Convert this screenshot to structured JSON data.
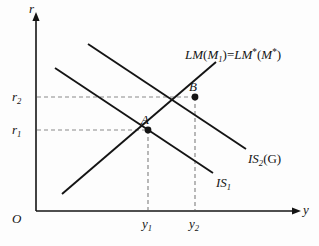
{
  "figure": {
    "type": "is-lm-diagram",
    "background_color": "#fdfdfd",
    "line_color": "#141414",
    "dash_color": "#8a8a8a"
  },
  "axes": {
    "vertical_label": "r",
    "horizontal_label": "y",
    "origin_label": "O"
  },
  "ticks": {
    "r1": {
      "base": "r",
      "sub": "1",
      "value_y": 130
    },
    "r2": {
      "base": "r",
      "sub": "2",
      "value_y": 97
    },
    "y1": {
      "base": "y",
      "sub": "1",
      "value_x": 148
    },
    "y2": {
      "base": "y",
      "sub": "2",
      "value_x": 195
    }
  },
  "curves": {
    "lm": {
      "label_base": "LM",
      "label_arg_open": "(",
      "label_m": "M",
      "label_m_sub": "1",
      "label_arg_close": ")",
      "label_equals": "=",
      "label_base2": "LM",
      "label_star1": "*",
      "label_arg2_open": "(",
      "label_m2": "M",
      "label_star2": "*",
      "label_arg2_close": ")"
    },
    "is1": {
      "base": "IS",
      "sub": "1"
    },
    "is2": {
      "base": "IS",
      "sub": "2",
      "arg": "(G)"
    }
  },
  "points": [
    {
      "name": "A",
      "label": "A",
      "x": 148,
      "y": 130
    },
    {
      "name": "B",
      "label": "B",
      "x": 195,
      "y": 97
    }
  ]
}
